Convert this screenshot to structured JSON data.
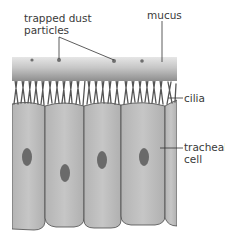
{
  "labels": {
    "dust": {
      "line1": "trapped dust",
      "line2": "particles"
    },
    "mucus": "mucus",
    "cilia": "cilia",
    "cell": {
      "line1": "tracheal",
      "line2": "cell"
    }
  },
  "colors": {
    "mucus_top": "#e4e4e4",
    "mucus_bottom": "#9a9a9a",
    "cilia": "#5a5a5a",
    "cell_fill": "#bdbdbd",
    "cell_outline": "#4a4a4a",
    "nucleus": "#6a6a6a",
    "leader_line": "#333333",
    "text": "#3a3a3a"
  },
  "geometry": {
    "mucus": {
      "x": 12,
      "y": 57,
      "w": 165,
      "h": 24
    },
    "dust_particles": [
      {
        "x": 32,
        "y": 60
      },
      {
        "x": 59,
        "y": 60
      },
      {
        "x": 114,
        "y": 61
      },
      {
        "x": 142,
        "y": 61
      }
    ],
    "cell_boundaries_x": [
      12,
      45,
      84,
      121,
      165,
      177
    ],
    "cell_top_y": 104,
    "cell_bottom_y": 226,
    "nuclei": [
      {
        "cx": 27,
        "cy": 157
      },
      {
        "cx": 65,
        "cy": 173
      },
      {
        "cx": 102,
        "cy": 160
      },
      {
        "cx": 144,
        "cy": 157
      }
    ]
  }
}
